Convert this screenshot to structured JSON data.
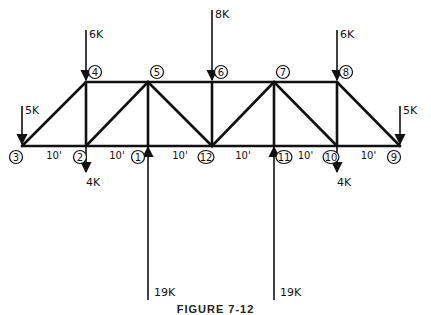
{
  "diagram": {
    "type": "truss",
    "caption": "FIGURE 7-12",
    "panel_length": "10'",
    "nodes": [
      {
        "id": "1",
        "label": "1",
        "x": 148,
        "y": 146,
        "chord": "bottom"
      },
      {
        "id": "2",
        "label": "2",
        "x": 86,
        "y": 146,
        "chord": "bottom"
      },
      {
        "id": "3",
        "label": "3",
        "x": 22,
        "y": 146,
        "chord": "bottom"
      },
      {
        "id": "4",
        "label": "4",
        "x": 86,
        "y": 82,
        "chord": "top"
      },
      {
        "id": "5",
        "label": "5",
        "x": 148,
        "y": 82,
        "chord": "top"
      },
      {
        "id": "6",
        "label": "6",
        "x": 212,
        "y": 82,
        "chord": "top"
      },
      {
        "id": "7",
        "label": "7",
        "x": 274,
        "y": 82,
        "chord": "top"
      },
      {
        "id": "8",
        "label": "8",
        "x": 337,
        "y": 82,
        "chord": "top"
      },
      {
        "id": "9",
        "label": "9",
        "x": 400,
        "y": 146,
        "chord": "bottom"
      },
      {
        "id": "10",
        "label": "10",
        "x": 337,
        "y": 146,
        "chord": "bottom"
      },
      {
        "id": "11",
        "label": "11",
        "x": 274,
        "y": 146,
        "chord": "bottom"
      },
      {
        "id": "12",
        "label": "12",
        "x": 212,
        "y": 146,
        "chord": "bottom"
      }
    ],
    "members": [
      [
        "3",
        "2"
      ],
      [
        "2",
        "1"
      ],
      [
        "1",
        "12"
      ],
      [
        "12",
        "11"
      ],
      [
        "11",
        "10"
      ],
      [
        "10",
        "9"
      ],
      [
        "4",
        "5"
      ],
      [
        "5",
        "6"
      ],
      [
        "6",
        "7"
      ],
      [
        "7",
        "8"
      ],
      [
        "3",
        "4"
      ],
      [
        "4",
        "2"
      ],
      [
        "2",
        "5"
      ],
      [
        "5",
        "1"
      ],
      [
        "5",
        "12"
      ],
      [
        "6",
        "12"
      ],
      [
        "12",
        "7"
      ],
      [
        "7",
        "11"
      ],
      [
        "7",
        "10"
      ],
      [
        "8",
        "10"
      ],
      [
        "8",
        "9"
      ]
    ],
    "dimensions": [
      {
        "label": "10'",
        "between": [
          "3",
          "2"
        ]
      },
      {
        "label": "10'",
        "between": [
          "2",
          "1"
        ]
      },
      {
        "label": "10'",
        "between": [
          "1",
          "12"
        ]
      },
      {
        "label": "10'",
        "between": [
          "12",
          "11"
        ]
      },
      {
        "label": "10'",
        "between": [
          "11",
          "10"
        ]
      },
      {
        "label": "10'",
        "between": [
          "10",
          "9"
        ]
      }
    ],
    "loads": [
      {
        "node": "3",
        "label": "5K",
        "direction": "down",
        "magnitude_k": 5
      },
      {
        "node": "4",
        "label": "6K",
        "direction": "down",
        "magnitude_k": 6
      },
      {
        "node": "6",
        "label": "8K",
        "direction": "down",
        "magnitude_k": 8
      },
      {
        "node": "8",
        "label": "6K",
        "direction": "down",
        "magnitude_k": 6
      },
      {
        "node": "9",
        "label": "5K",
        "direction": "down",
        "magnitude_k": 5
      },
      {
        "node": "2",
        "label": "4K",
        "direction": "down",
        "magnitude_k": 4
      },
      {
        "node": "10",
        "label": "4K",
        "direction": "down",
        "magnitude_k": 4
      }
    ],
    "reactions": [
      {
        "node": "1",
        "label": "19K",
        "direction": "up",
        "magnitude_k": 19
      },
      {
        "node": "11",
        "label": "19K",
        "direction": "up",
        "magnitude_k": 19
      }
    ]
  }
}
